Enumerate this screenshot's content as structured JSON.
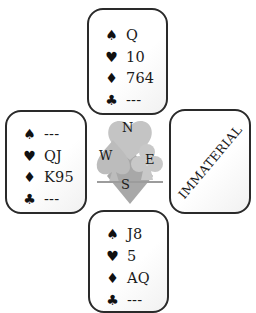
{
  "diagram": {
    "type": "bridge-hand-diagram",
    "suits": {
      "spades": "♠",
      "hearts": "♥",
      "diamonds": "♦",
      "clubs": "♣"
    },
    "hands": {
      "north": {
        "spades": "Q",
        "hearts": "10",
        "diamonds": "764",
        "clubs": "---"
      },
      "west": {
        "spades": "---",
        "hearts": "QJ",
        "diamonds": "K95",
        "clubs": "---"
      },
      "east": {
        "label": "IMMATERIAL"
      },
      "south": {
        "spades": "J8",
        "hearts": "5",
        "diamonds": "AQ",
        "clubs": "---"
      }
    },
    "compass": {
      "north": "N",
      "west": "W",
      "east": "E",
      "south": "S"
    },
    "colors": {
      "border": "#2a2a2a",
      "logo_gray": "#b5b5b5",
      "logo_dark_gray": "#9a9a9a",
      "text": "#1a1a1a"
    }
  }
}
